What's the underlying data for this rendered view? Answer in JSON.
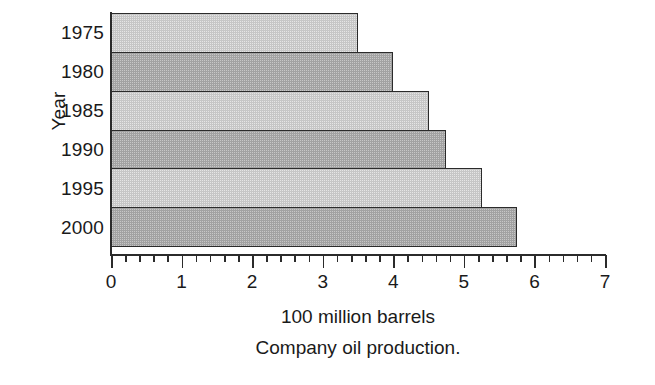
{
  "chart_data": {
    "type": "bar",
    "orientation": "horizontal",
    "title": "",
    "caption": "Company oil production.",
    "categories": [
      "1975",
      "1980",
      "1985",
      "1990",
      "1995",
      "2000"
    ],
    "values": [
      3.5,
      4.0,
      4.5,
      4.75,
      5.25,
      5.75
    ],
    "xlabel": "100 million barrels",
    "ylabel": "Year",
    "xlim": [
      0,
      7
    ],
    "x_ticks": [
      0,
      1,
      2,
      3,
      4,
      5,
      6,
      7
    ],
    "x_tick_labels": [
      "0",
      "1",
      "2",
      "3",
      "4",
      "5",
      "6",
      "7"
    ],
    "x_minor_tick_interval": 0.2,
    "grid": false,
    "legend": false,
    "bar_colors": [
      "#c6c6c6",
      "#a2a2a2",
      "#c6c6c6",
      "#a2a2a2",
      "#c6c6c6",
      "#a2a2a2"
    ],
    "bar_edge_color": "#2b2b2b",
    "background_color": "#ffffff"
  },
  "axes": {
    "y_title": "Year",
    "x_title": "100 million barrels"
  },
  "figure": {
    "caption": "Company oil production."
  }
}
